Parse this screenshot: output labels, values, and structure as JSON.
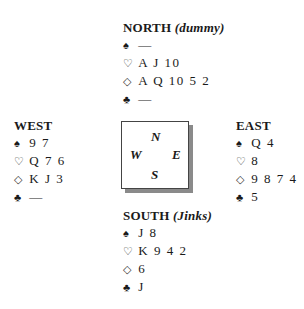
{
  "suit_symbols": {
    "spades": "♠",
    "hearts": "♡",
    "diamonds": "◇",
    "clubs": "♣"
  },
  "hands": {
    "north": {
      "label": "NORTH",
      "note": "(dummy)",
      "spades": "—",
      "hearts": "A J 10",
      "diamonds": "A Q 10 5 2",
      "clubs": "—"
    },
    "west": {
      "label": "WEST",
      "note": "",
      "spades": "9 7",
      "hearts": "Q 7 6",
      "diamonds": "K J 3",
      "clubs": "—"
    },
    "east": {
      "label": "EAST",
      "note": "",
      "spades": "Q 4",
      "hearts": "8",
      "diamonds": "9 8 7 4",
      "clubs": "5"
    },
    "south": {
      "label": "SOUTH",
      "note": "(Jinks)",
      "spades": "J 8",
      "hearts": "K 9 4 2",
      "diamonds": "6",
      "clubs": "J"
    }
  },
  "compass": {
    "n": "N",
    "w": "W",
    "e": "E",
    "s": "S"
  }
}
